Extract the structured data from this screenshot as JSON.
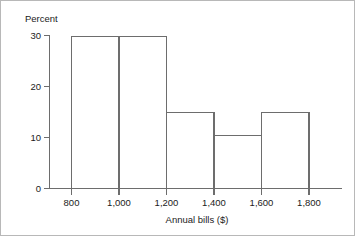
{
  "chart_data": {
    "type": "bar",
    "title": "",
    "subtitle": "",
    "xlabel": "Annual bills ($)",
    "ylabel": "Percent",
    "categories": [
      "800-1,000",
      "1,000-1,200",
      "1,200-1,400",
      "1,400-1,600",
      "1,600-1,800"
    ],
    "bin_edges": [
      800,
      1000,
      1200,
      1400,
      1600,
      1800
    ],
    "values": [
      30,
      30,
      15,
      10.5,
      15
    ],
    "xlim": [
      700,
      1900
    ],
    "ylim": [
      0,
      30
    ],
    "x_ticks": [
      800,
      1000,
      1200,
      1400,
      1600,
      1800
    ],
    "x_tick_labels": [
      "800",
      "1,000",
      "1,200",
      "1,400",
      "1,600",
      "1,800"
    ],
    "y_ticks": [
      0,
      10,
      20,
      30
    ],
    "y_tick_labels": [
      "0",
      "10",
      "20",
      "30"
    ],
    "grid": false,
    "legend": null,
    "legend_position": "none",
    "annotations": [],
    "colors": {
      "line": "#6d6d6d",
      "fill": "#ffffff",
      "text": "#1b1b1b",
      "background": "#ffffff",
      "frame": "#b8b8b8"
    }
  }
}
